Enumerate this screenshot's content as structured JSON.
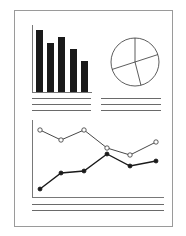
{
  "colors": {
    "background": "#ffffff",
    "page_border": "#9a9a9a",
    "ink": "#1a1a1a",
    "rule": "#444444"
  },
  "document": {
    "icon": "report-document-icon"
  },
  "chart_data": [
    {
      "type": "bar",
      "title": "",
      "categories": [
        "1",
        "2",
        "3",
        "4",
        "5"
      ],
      "values": [
        62,
        49,
        55,
        43,
        31
      ],
      "xlabel": "",
      "ylabel": "",
      "ylim": [
        0,
        67
      ],
      "grid": false
    },
    {
      "type": "pie",
      "title": "",
      "slices": [
        {
          "label": "A",
          "value": 20
        },
        {
          "label": "B",
          "value": 26
        },
        {
          "label": "C",
          "value": 24
        },
        {
          "label": "D",
          "value": 30
        }
      ]
    },
    {
      "type": "line",
      "title": "",
      "x": [
        1,
        2,
        3,
        4,
        5,
        6
      ],
      "series": [
        {
          "name": "open-markers",
          "values": [
            67,
            57,
            67,
            49,
            42,
            55
          ]
        },
        {
          "name": "filled-markers",
          "values": [
            8,
            24,
            26,
            43,
            31,
            36
          ]
        }
      ],
      "xlabel": "",
      "ylabel": "",
      "ylim": [
        0,
        77
      ],
      "grid": false
    }
  ]
}
